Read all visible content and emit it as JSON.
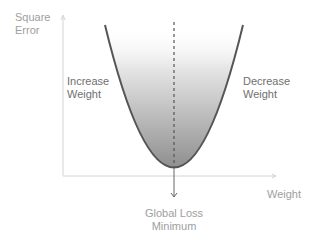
{
  "diagram": {
    "y_axis_label": [
      "Square",
      "Error"
    ],
    "x_axis_label": "Weight",
    "left_region_label": [
      "Increase",
      "Weight"
    ],
    "right_region_label": [
      "Decrease",
      "Weight"
    ],
    "minimum_label": [
      "Global Loss",
      "Minimum"
    ],
    "curve_type": "parabola",
    "colors": {
      "axis": "#d0d0d0",
      "curve": "#555555",
      "fill_dark": "#8a8a8a",
      "text_light": "#9e9e9e",
      "text_dark": "#6f6f6f"
    }
  }
}
